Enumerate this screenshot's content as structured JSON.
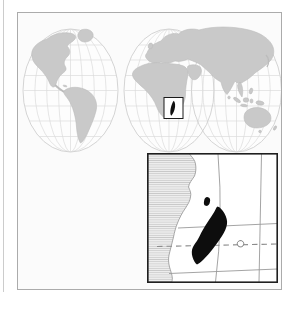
{
  "meta": {
    "kind": "locator-map"
  },
  "colors": {
    "page_bg": "#ffffff",
    "panel_bg": "#fbfbfb",
    "panel_border": "#ababab",
    "ocean": "#fdfdfd",
    "globe_outline": "#cfcfcf",
    "graticule": "#dbdbdb",
    "land": "#c9c9c9",
    "land_edge": "#bcbcbc",
    "highlight_box_border": "#1a1a1a",
    "highlight_fill": "#111111",
    "inset_bg": "#ffffff",
    "inset_border": "#1f1f1f",
    "inset_grid": "#9a9a9a",
    "tropic_dash": "#8c8c8c",
    "coast_line": "#9e9e9e",
    "hatch_bg": "#efefef",
    "hatch_line": "#c9c9c9",
    "island_fill": "#0d0d0d",
    "small_island_outline": "#606060",
    "edge_artifact": "#cccccc"
  },
  "map": {
    "west_hemisphere": "western-hemisphere-americas",
    "east_hemisphere": "eastern-hemisphere-africa-eurasia-australia",
    "highlight_region": "madagascar"
  },
  "inset": {
    "region": "madagascar-detail",
    "mainland": "african-east-coast",
    "dashed_line": "tropic-line",
    "small_island": "offshore-islet"
  }
}
